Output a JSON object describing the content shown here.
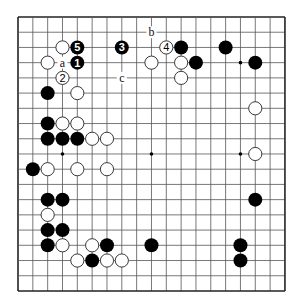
{
  "board": {
    "size": 19,
    "origin_x": 18,
    "origin_y": 17,
    "step_x": 14.83,
    "step_y": 15.22,
    "stone_radius": 7,
    "line_color": "#555555",
    "border_color": "#222222",
    "hoshi": [
      [
        3,
        3
      ],
      [
        9,
        3
      ],
      [
        15,
        3
      ],
      [
        3,
        9
      ],
      [
        9,
        9
      ],
      [
        15,
        9
      ],
      [
        3,
        15
      ],
      [
        9,
        15
      ],
      [
        15,
        15
      ]
    ]
  },
  "stones": {
    "black": [
      {
        "x": 4,
        "y": 3,
        "label": "1"
      },
      {
        "x": 7,
        "y": 2,
        "label": "3"
      },
      {
        "x": 4,
        "y": 2,
        "label": "5"
      },
      {
        "x": 11,
        "y": 2
      },
      {
        "x": 14,
        "y": 2
      },
      {
        "x": 12,
        "y": 3
      },
      {
        "x": 16,
        "y": 3
      },
      {
        "x": 2,
        "y": 5
      },
      {
        "x": 2,
        "y": 7
      },
      {
        "x": 2,
        "y": 8
      },
      {
        "x": 3,
        "y": 8
      },
      {
        "x": 4,
        "y": 8
      },
      {
        "x": 1,
        "y": 10
      },
      {
        "x": 2,
        "y": 12
      },
      {
        "x": 3,
        "y": 12
      },
      {
        "x": 2,
        "y": 14
      },
      {
        "x": 3,
        "y": 14
      },
      {
        "x": 2,
        "y": 15
      },
      {
        "x": 6,
        "y": 15
      },
      {
        "x": 9,
        "y": 15
      },
      {
        "x": 15,
        "y": 15
      },
      {
        "x": 5,
        "y": 16
      },
      {
        "x": 15,
        "y": 16
      },
      {
        "x": 16,
        "y": 12
      }
    ],
    "white": [
      {
        "x": 3,
        "y": 4,
        "label": "2"
      },
      {
        "x": 10,
        "y": 2,
        "label": "4"
      },
      {
        "x": 3,
        "y": 2
      },
      {
        "x": 2,
        "y": 3
      },
      {
        "x": 9,
        "y": 3
      },
      {
        "x": 11,
        "y": 3
      },
      {
        "x": 11,
        "y": 4
      },
      {
        "x": 4,
        "y": 5
      },
      {
        "x": 3,
        "y": 7
      },
      {
        "x": 4,
        "y": 7
      },
      {
        "x": 5,
        "y": 8
      },
      {
        "x": 6,
        "y": 8
      },
      {
        "x": 2,
        "y": 10
      },
      {
        "x": 4,
        "y": 10
      },
      {
        "x": 6,
        "y": 10
      },
      {
        "x": 16,
        "y": 6
      },
      {
        "x": 16,
        "y": 9
      },
      {
        "x": 2,
        "y": 13
      },
      {
        "x": 3,
        "y": 15
      },
      {
        "x": 5,
        "y": 15
      },
      {
        "x": 4,
        "y": 16
      },
      {
        "x": 6,
        "y": 16
      },
      {
        "x": 7,
        "y": 16
      }
    ]
  },
  "marks": [
    {
      "x": 3,
      "y": 3,
      "label": "a"
    },
    {
      "x": 9,
      "y": 1,
      "label": "b"
    },
    {
      "x": 7,
      "y": 4,
      "label": "c"
    }
  ]
}
